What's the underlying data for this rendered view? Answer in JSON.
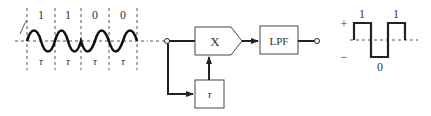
{
  "input_signal": {
    "bits": [
      "1",
      "1",
      "0",
      "0"
    ],
    "interval_label": "τ",
    "interval_labels": [
      "τ",
      "τ",
      "τ",
      "τ"
    ],
    "description": "Phase-modulated sinusoid, one period per bit interval"
  },
  "block_diagram": {
    "multiplier_label": "X",
    "delay_label": "τ",
    "filter_label": "LPF"
  },
  "output_signal": {
    "plus_label": "+",
    "minus_label": "−",
    "levels": [
      {
        "label": "1",
        "polarity": "+"
      },
      {
        "label": "0",
        "polarity": "−"
      },
      {
        "label": "1",
        "polarity": "+"
      }
    ],
    "bit_labels": [
      "1",
      "0",
      "1"
    ]
  },
  "colors": {
    "line": "#222222",
    "dashed": "#555555",
    "background": "#ffffff"
  }
}
